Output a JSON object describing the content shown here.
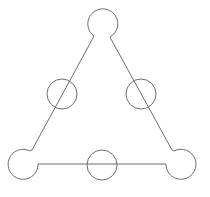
{
  "diagram": {
    "type": "triangle-with-circles",
    "stroke_color": "#6e6e6e",
    "background": "#ffffff",
    "circles": [
      {
        "id": "top",
        "cx": 102,
        "cy": 22,
        "r": 15
      },
      {
        "id": "mid-left",
        "cx": 62,
        "cy": 94,
        "r": 15
      },
      {
        "id": "mid-right",
        "cx": 141,
        "cy": 94,
        "r": 15
      },
      {
        "id": "bottom-left",
        "cx": 23,
        "cy": 165,
        "r": 15
      },
      {
        "id": "bottom-middle",
        "cx": 102,
        "cy": 165,
        "r": 15
      },
      {
        "id": "bottom-right",
        "cx": 180,
        "cy": 164,
        "r": 15
      }
    ],
    "edges": [
      {
        "id": "left-edge",
        "from": "top",
        "to": "bottom-left"
      },
      {
        "id": "right-edge",
        "from": "top",
        "to": "bottom-right"
      },
      {
        "id": "bottom-edge",
        "from": "bottom-left",
        "to": "bottom-right"
      }
    ]
  }
}
